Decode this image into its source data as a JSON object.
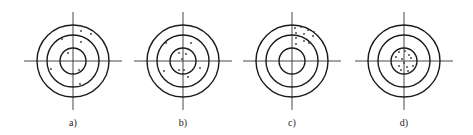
{
  "figure": {
    "width": 473,
    "height": 135,
    "colors": {
      "ring": "#1a1a1a",
      "axis": "#333333",
      "shot": "#3a3a3a",
      "label": "#222222"
    },
    "ring_radii": [
      36,
      26,
      13
    ],
    "axis_half_length": 49,
    "targets": [
      {
        "label": "a)",
        "cx": 73,
        "cy": 61,
        "label_y": 126,
        "shots": [
          [
            81,
            31
          ],
          [
            91,
            34
          ],
          [
            62,
            39
          ],
          [
            81,
            42
          ],
          [
            68,
            53
          ],
          [
            51,
            69
          ],
          [
            79,
            70
          ],
          [
            80,
            84
          ]
        ]
      },
      {
        "label": "b)",
        "cx": 183,
        "cy": 61,
        "label_y": 126,
        "shots": [
          [
            166,
            43
          ],
          [
            191,
            43
          ],
          [
            179,
            53
          ],
          [
            186,
            54
          ],
          [
            182,
            59
          ],
          [
            200,
            68
          ],
          [
            164,
            71
          ],
          [
            179,
            70
          ],
          [
            184,
            70
          ],
          [
            188,
            77
          ]
        ]
      },
      {
        "label": "c)",
        "cx": 292,
        "cy": 61,
        "label_y": 126,
        "shots": [
          [
            295,
            28
          ],
          [
            301,
            27
          ],
          [
            308,
            30
          ],
          [
            314,
            32
          ],
          [
            296,
            33
          ],
          [
            304,
            34
          ],
          [
            313,
            36
          ],
          [
            296,
            38
          ],
          [
            304,
            41
          ],
          [
            309,
            43
          ],
          [
            296,
            44
          ]
        ]
      },
      {
        "label": "d)",
        "cx": 404,
        "cy": 61,
        "label_y": 126,
        "shots": [
          [
            399,
            52
          ],
          [
            405,
            51
          ],
          [
            409,
            55
          ],
          [
            396,
            57
          ],
          [
            402,
            59
          ],
          [
            411,
            58
          ],
          [
            404,
            63
          ],
          [
            399,
            66
          ],
          [
            407,
            67
          ],
          [
            413,
            66
          ],
          [
            401,
            70
          ],
          [
            408,
            71
          ]
        ]
      }
    ]
  }
}
